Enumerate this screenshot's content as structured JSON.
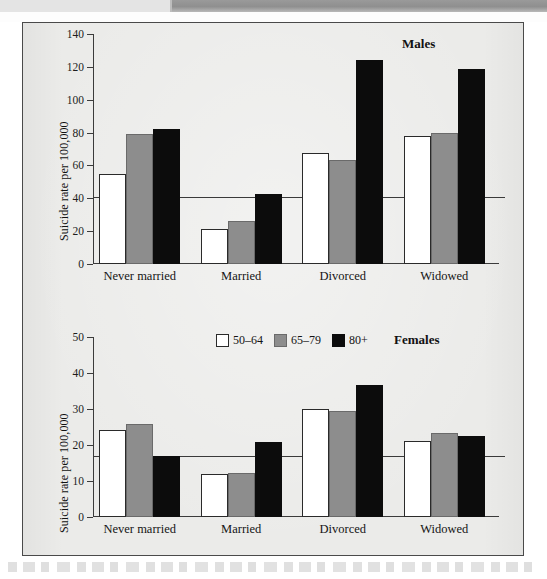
{
  "figure": {
    "legend": {
      "items": [
        {
          "label": "50–64",
          "swatch": "white",
          "color": "#ffffff"
        },
        {
          "label": "65–79",
          "swatch": "gray",
          "color": "#8d8d8d"
        },
        {
          "label": "80+",
          "swatch": "black",
          "color": "#0c0c0c"
        }
      ]
    }
  },
  "chart_data": [
    {
      "type": "bar",
      "title": "Males",
      "xlabel": "",
      "ylabel": "Suicide rate per 100,000",
      "ylim": [
        0,
        140
      ],
      "yticks": [
        0,
        20,
        40,
        60,
        80,
        100,
        120,
        140
      ],
      "ytick_labels": [
        "0",
        "20",
        "40",
        "60",
        "80",
        "100",
        "120",
        "140"
      ],
      "grid": false,
      "legend_position": "between-panels",
      "reference_line": {
        "value": 40,
        "label": ""
      },
      "categories": [
        "Never married",
        "Married",
        "Divorced",
        "Widowed"
      ],
      "series": [
        {
          "name": "50–64",
          "color": "#ffffff",
          "values": [
            55,
            21.5,
            67.5,
            78
          ]
        },
        {
          "name": "65–79",
          "color": "#8d8d8d",
          "values": [
            79,
            26,
            63.5,
            79.5
          ]
        },
        {
          "name": "80+",
          "color": "#0c0c0c",
          "values": [
            82,
            42.5,
            124,
            119
          ]
        }
      ]
    },
    {
      "type": "bar",
      "title": "Females",
      "xlabel": "",
      "ylabel": "Suicide rate per 100,000",
      "ylim": [
        0,
        50
      ],
      "yticks": [
        0,
        10,
        20,
        30,
        40,
        50
      ],
      "ytick_labels": [
        "0",
        "10",
        "20",
        "30",
        "40",
        "50"
      ],
      "grid": false,
      "legend_position": "top-center",
      "reference_line": {
        "value": 16.6,
        "label": ""
      },
      "categories": [
        "Never married",
        "Married",
        "Divorced",
        "Widowed"
      ],
      "series": [
        {
          "name": "50–64",
          "color": "#ffffff",
          "values": [
            24.2,
            11.9,
            30.0,
            21.2
          ]
        },
        {
          "name": "65–79",
          "color": "#8d8d8d",
          "values": [
            25.8,
            12.3,
            29.4,
            23.3
          ]
        },
        {
          "name": "80+",
          "color": "#0c0c0c",
          "values": [
            16.9,
            20.9,
            36.8,
            22.5
          ]
        }
      ]
    }
  ]
}
